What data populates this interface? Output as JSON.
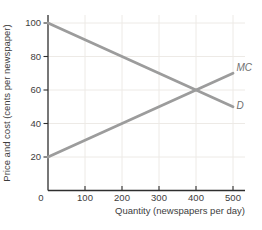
{
  "chart_data": {
    "type": "line",
    "title": "",
    "xlabel": "Quantity (newspapers per day)",
    "ylabel": "Price and cost (cents per newspaper)",
    "origin_label": "0",
    "xticks": [
      100,
      200,
      300,
      400,
      500
    ],
    "yticks": [
      20,
      40,
      60,
      80,
      100
    ],
    "xlim": [
      0,
      535
    ],
    "ylim": [
      0,
      105
    ],
    "grid": true,
    "legend_position": "line-end-labels",
    "series": [
      {
        "name": "MC",
        "x": [
          0,
          500
        ],
        "y": [
          20,
          70
        ]
      },
      {
        "name": "D",
        "x": [
          0,
          500
        ],
        "y": [
          100,
          50
        ]
      }
    ],
    "intersection": {
      "x": 400,
      "y": 60
    },
    "colors": {
      "curve": "#9c9c9c",
      "axis": "#2e2e2e",
      "tick_text": "#3d3d3d",
      "curve_label": "#6f6f6f",
      "grid": "#edeae6",
      "background": "#ffffff"
    }
  }
}
